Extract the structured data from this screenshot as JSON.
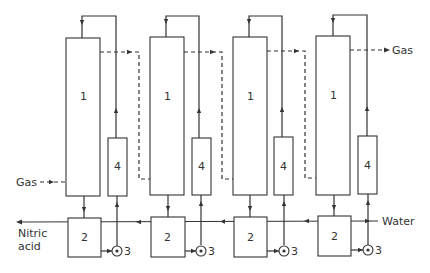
{
  "diagram": {
    "stage_count": 4,
    "stages": [
      {
        "column_label": "1",
        "tank_label": "2",
        "pump_label": "3",
        "cooler_label": "4"
      },
      {
        "column_label": "1",
        "tank_label": "2",
        "pump_label": "3",
        "cooler_label": "4"
      },
      {
        "column_label": "1",
        "tank_label": "2",
        "pump_label": "3",
        "cooler_label": "4"
      },
      {
        "column_label": "1",
        "tank_label": "2",
        "pump_label": "3",
        "cooler_label": "4"
      }
    ],
    "labels": {
      "gas_in": "Gas",
      "gas_out": "Gas",
      "water_in": "Water",
      "product_line1": "Nitric",
      "product_line2": "acid"
    },
    "legend": {
      "1": "Absorption column",
      "2": "Collecting tank",
      "3": "Pump",
      "4": "Cooler"
    },
    "line_styles": {
      "gas": "dashed",
      "liquid": "solid"
    }
  }
}
